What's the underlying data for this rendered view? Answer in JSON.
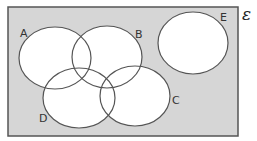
{
  "diagram": {
    "type": "venn",
    "universal_set": {
      "symbol": "ε",
      "fill": "#d6d6d6",
      "stroke": "#555555"
    },
    "set_fill": "#ffffff",
    "set_stroke": "#555555",
    "sets": [
      {
        "label": "A"
      },
      {
        "label": "B"
      },
      {
        "label": "C"
      },
      {
        "label": "D"
      },
      {
        "label": "E"
      }
    ]
  }
}
